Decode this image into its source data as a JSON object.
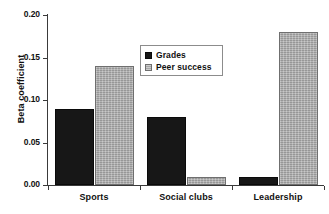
{
  "chart_data": {
    "type": "bar",
    "title": "",
    "xlabel": "",
    "ylabel": "Beta coefficient",
    "categories": [
      "Sports",
      "Social clubs",
      "Leadership"
    ],
    "series": [
      {
        "name": "Grades",
        "values": [
          0.09,
          0.08,
          0.01
        ],
        "color": "#171717"
      },
      {
        "name": "Peer success",
        "values": [
          0.14,
          0.01,
          0.18
        ],
        "color": "#a9a9a9"
      }
    ],
    "ylim": [
      0.0,
      0.2
    ],
    "ytick_values": [
      0.0,
      0.05,
      0.1,
      0.15,
      0.2
    ],
    "ytick_labels": [
      "0.00",
      "0.05",
      "0.10",
      "0.15",
      "0.20"
    ],
    "grid": false,
    "legend_position": "upper center",
    "legend_entries": [
      "Grades",
      "Peer success"
    ],
    "background": "#ffffff",
    "axis_color": "#3a3a3a"
  }
}
